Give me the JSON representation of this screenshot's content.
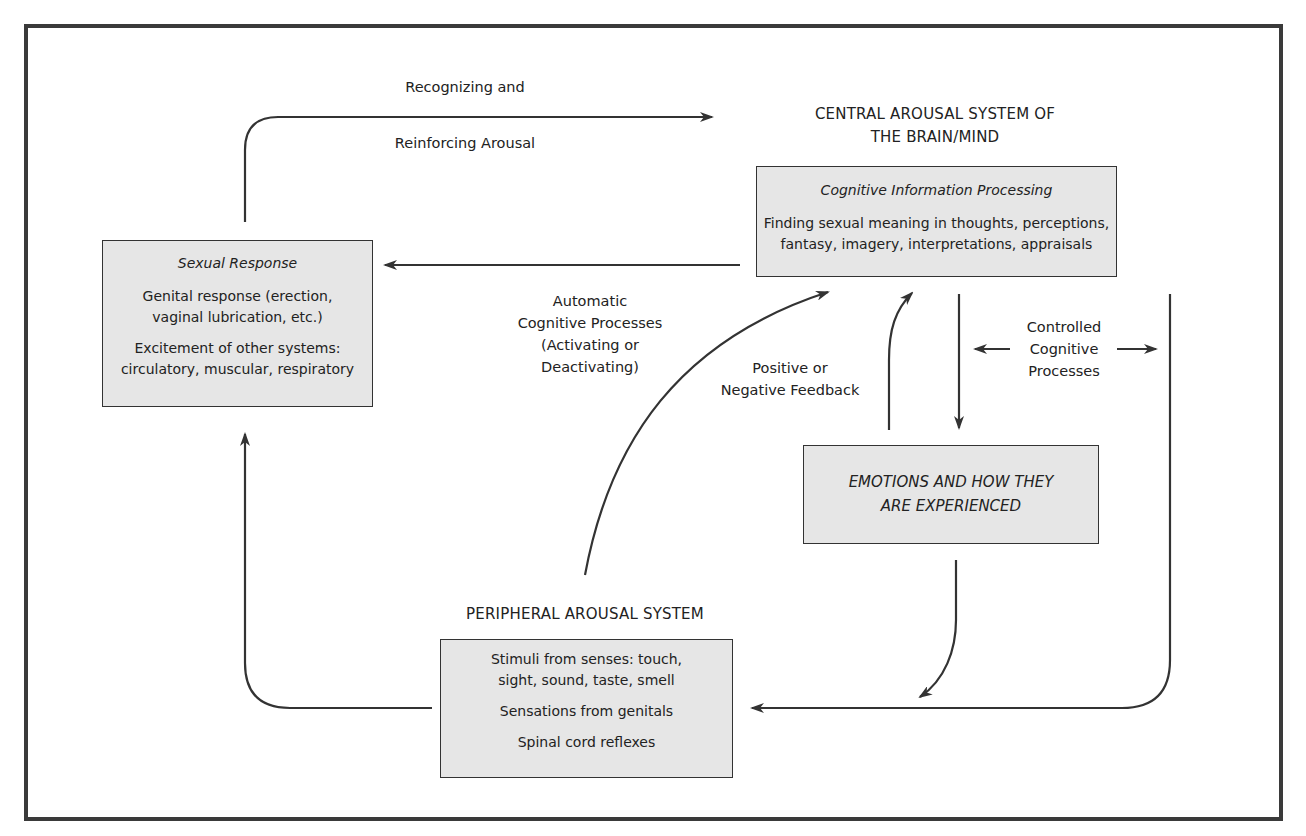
{
  "diagram": {
    "central_system": {
      "heading_line1": "CENTRAL AROUSAL SYSTEM OF",
      "heading_line2": "THE BRAIN/MIND",
      "box_title": "Cognitive Information Processing",
      "box_text_line1": "Finding sexual meaning in thoughts, perceptions,",
      "box_text_line2": "fantasy, imagery, interpretations, appraisals"
    },
    "sexual_response": {
      "box_title": "Sexual Response",
      "item1_line1": "Genital response (erection,",
      "item1_line2": "vaginal lubrication, etc.)",
      "item2_line1": "Excitement of other systems:",
      "item2_line2": "circulatory, muscular, respiratory"
    },
    "emotions": {
      "line1": "EMOTIONS AND HOW THEY",
      "line2": "ARE EXPERIENCED"
    },
    "peripheral_system": {
      "heading": "PERIPHERAL AROUSAL SYSTEM",
      "item1_line1": "Stimuli from senses: touch,",
      "item1_line2": "sight, sound, taste, smell",
      "item2": "Sensations from genitals",
      "item3": "Spinal cord reflexes"
    },
    "edge_labels": {
      "recognizing_line1": "Recognizing and",
      "recognizing_line2": "Reinforcing Arousal",
      "automatic_line1": "Automatic",
      "automatic_line2": "Cognitive Processes",
      "automatic_line3": "(Activating or",
      "automatic_line4": "Deactivating)",
      "feedback_line1": "Positive or",
      "feedback_line2": "Negative Feedback",
      "controlled_line1": "Controlled",
      "controlled_line2": "Cognitive",
      "controlled_line3": "Processes"
    },
    "colors": {
      "box_fill": "#e6e6e6",
      "stroke": "#333333",
      "frame": "#3a3a3a"
    }
  }
}
